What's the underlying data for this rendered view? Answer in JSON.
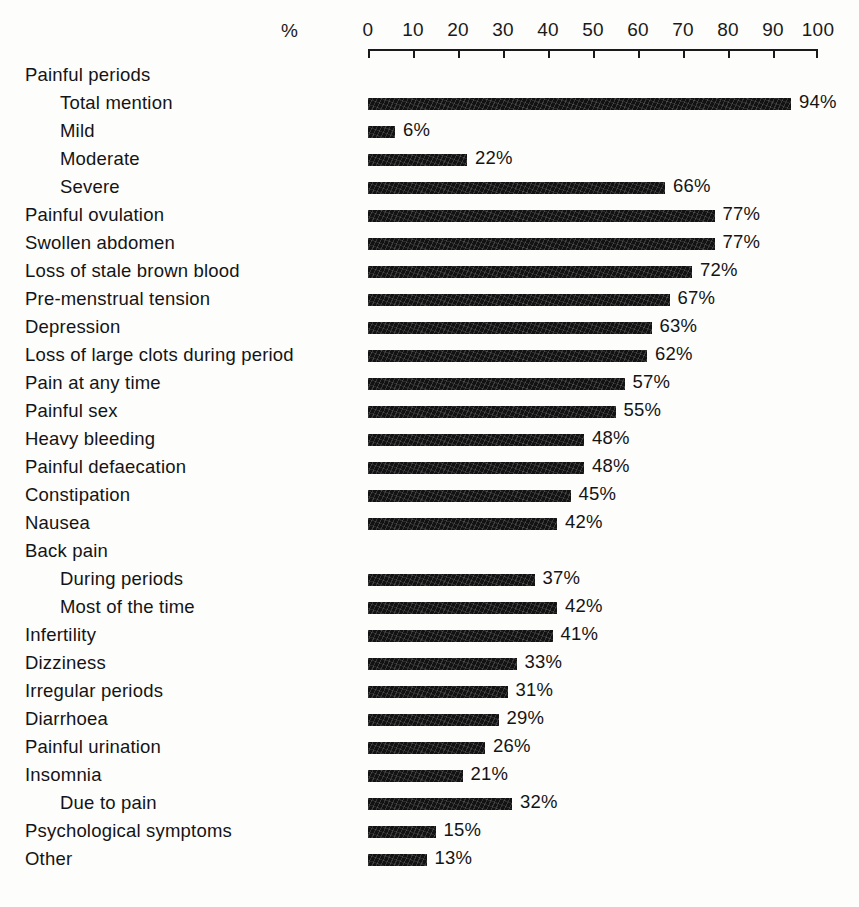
{
  "chart_data": {
    "type": "bar",
    "orientation": "horizontal",
    "title": "",
    "subtitle": "",
    "xlabel": "%",
    "ylabel": "",
    "xlim": [
      0,
      100
    ],
    "grid": false,
    "legend": null,
    "axis": {
      "unit_label": "%",
      "ticks": [
        0,
        10,
        20,
        30,
        40,
        50,
        60,
        70,
        80,
        90,
        100
      ],
      "tick_labels": [
        "0",
        "10",
        "20",
        "30",
        "40",
        "50",
        "60",
        "70",
        "80",
        "90",
        "100"
      ]
    },
    "categories": [
      "Painful periods",
      "Total mention",
      "Mild",
      "Moderate",
      "Severe",
      "Painful ovulation",
      "Swollen abdomen",
      "Loss of stale brown blood",
      "Pre-menstrual tension",
      "Depression",
      "Loss of large clots during period",
      "Pain at any time",
      "Painful sex",
      "Heavy bleeding",
      "Painful defaecation",
      "Constipation",
      "Nausea",
      "Back pain",
      "During periods",
      "Most of the time",
      "Infertility",
      "Dizziness",
      "Irregular periods",
      "Diarrhoea",
      "Painful urination",
      "Insomnia",
      "Due to pain",
      "Psychological symptoms",
      "Other"
    ],
    "values": [
      null,
      94,
      6,
      22,
      66,
      77,
      77,
      72,
      67,
      63,
      62,
      57,
      55,
      48,
      48,
      45,
      42,
      null,
      37,
      42,
      41,
      33,
      31,
      29,
      26,
      21,
      32,
      15,
      13
    ],
    "rows": [
      {
        "label": "Painful periods",
        "value": null,
        "value_label": "",
        "indent": false,
        "is_header": true
      },
      {
        "label": "Total mention",
        "value": 94,
        "value_label": "94%",
        "indent": true,
        "is_header": false
      },
      {
        "label": "Mild",
        "value": 6,
        "value_label": "6%",
        "indent": true,
        "is_header": false
      },
      {
        "label": "Moderate",
        "value": 22,
        "value_label": "22%",
        "indent": true,
        "is_header": false
      },
      {
        "label": "Severe",
        "value": 66,
        "value_label": "66%",
        "indent": true,
        "is_header": false
      },
      {
        "label": "Painful ovulation",
        "value": 77,
        "value_label": "77%",
        "indent": false,
        "is_header": false
      },
      {
        "label": "Swollen abdomen",
        "value": 77,
        "value_label": "77%",
        "indent": false,
        "is_header": false
      },
      {
        "label": "Loss of stale brown blood",
        "value": 72,
        "value_label": "72%",
        "indent": false,
        "is_header": false
      },
      {
        "label": "Pre-menstrual tension",
        "value": 67,
        "value_label": "67%",
        "indent": false,
        "is_header": false
      },
      {
        "label": "Depression",
        "value": 63,
        "value_label": "63%",
        "indent": false,
        "is_header": false
      },
      {
        "label": "Loss of large clots during period",
        "value": 62,
        "value_label": "62%",
        "indent": false,
        "is_header": false
      },
      {
        "label": "Pain at any time",
        "value": 57,
        "value_label": "57%",
        "indent": false,
        "is_header": false
      },
      {
        "label": "Painful sex",
        "value": 55,
        "value_label": "55%",
        "indent": false,
        "is_header": false
      },
      {
        "label": "Heavy bleeding",
        "value": 48,
        "value_label": "48%",
        "indent": false,
        "is_header": false
      },
      {
        "label": "Painful defaecation",
        "value": 48,
        "value_label": "48%",
        "indent": false,
        "is_header": false
      },
      {
        "label": "Constipation",
        "value": 45,
        "value_label": "45%",
        "indent": false,
        "is_header": false
      },
      {
        "label": "Nausea",
        "value": 42,
        "value_label": "42%",
        "indent": false,
        "is_header": false
      },
      {
        "label": "Back pain",
        "value": null,
        "value_label": "",
        "indent": false,
        "is_header": true
      },
      {
        "label": "During periods",
        "value": 37,
        "value_label": "37%",
        "indent": true,
        "is_header": false
      },
      {
        "label": "Most of the time",
        "value": 42,
        "value_label": "42%",
        "indent": true,
        "is_header": false
      },
      {
        "label": "Infertility",
        "value": 41,
        "value_label": "41%",
        "indent": false,
        "is_header": false
      },
      {
        "label": "Dizziness",
        "value": 33,
        "value_label": "33%",
        "indent": false,
        "is_header": false
      },
      {
        "label": "Irregular periods",
        "value": 31,
        "value_label": "31%",
        "indent": false,
        "is_header": false
      },
      {
        "label": "Diarrhoea",
        "value": 29,
        "value_label": "29%",
        "indent": false,
        "is_header": false
      },
      {
        "label": "Painful urination",
        "value": 26,
        "value_label": "26%",
        "indent": false,
        "is_header": false
      },
      {
        "label": "Insomnia",
        "value": 21,
        "value_label": "21%",
        "indent": false,
        "is_header": false
      },
      {
        "label": "Due to pain",
        "value": 32,
        "value_label": "32%",
        "indent": true,
        "is_header": false
      },
      {
        "label": "Psychological symptoms",
        "value": 15,
        "value_label": "15%",
        "indent": false,
        "is_header": false
      },
      {
        "label": "Other",
        "value": 13,
        "value_label": "13%",
        "indent": false,
        "is_header": false
      }
    ],
    "colors": {
      "bar": "#121212",
      "text": "#141414",
      "axis": "#1a1a1a",
      "background": "#fdfdfc"
    }
  }
}
